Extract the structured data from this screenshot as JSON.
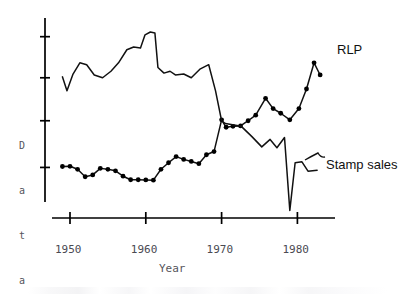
{
  "chart_data": {
    "type": "line",
    "title": "",
    "xlabel": "Year",
    "ylabel": "Data",
    "ylabel_letters": [
      "D",
      "a",
      "t",
      "a"
    ],
    "xlim": [
      1948.5,
      1983.5
    ],
    "ylim": [
      0,
      100
    ],
    "grid": false,
    "legend_position": "right-inline",
    "x_tick_labels": [
      "1950",
      "1960",
      "1970",
      "1980"
    ],
    "x_ticks": [
      1950,
      1960,
      1970,
      1980
    ],
    "y_ticks": [
      20,
      45,
      68,
      90
    ],
    "y_tick_labels": [
      "",
      "",
      "",
      ""
    ],
    "axis_color": "#000000",
    "line_color": "#1a1a1a",
    "marker_color": "#000000",
    "background": "#ffffff",
    "series": [
      {
        "name": "RLP",
        "label": "RLP",
        "markers": true,
        "marker_shape": "circle",
        "color": "#111111",
        "points": [
          {
            "x": 1949.0,
            "y": 20.5
          },
          {
            "x": 1950.0,
            "y": 20.6
          },
          {
            "x": 1951.0,
            "y": 19.0
          },
          {
            "x": 1952.0,
            "y": 15.0
          },
          {
            "x": 1953.0,
            "y": 16.0
          },
          {
            "x": 1954.0,
            "y": 19.5
          },
          {
            "x": 1955.0,
            "y": 19.0
          },
          {
            "x": 1956.0,
            "y": 18.2
          },
          {
            "x": 1957.0,
            "y": 15.3
          },
          {
            "x": 1958.0,
            "y": 13.4
          },
          {
            "x": 1959.0,
            "y": 13.4
          },
          {
            "x": 1960.0,
            "y": 13.3
          },
          {
            "x": 1961.0,
            "y": 13.2
          },
          {
            "x": 1962.0,
            "y": 19.0
          },
          {
            "x": 1963.0,
            "y": 22.5
          },
          {
            "x": 1964.0,
            "y": 25.8
          },
          {
            "x": 1965.0,
            "y": 24.3
          },
          {
            "x": 1966.0,
            "y": 23.2
          },
          {
            "x": 1967.0,
            "y": 22.0
          },
          {
            "x": 1968.0,
            "y": 26.8
          },
          {
            "x": 1969.0,
            "y": 28.5
          },
          {
            "x": 1970.0,
            "y": 45.5
          },
          {
            "x": 1970.6,
            "y": 41.5
          },
          {
            "x": 1971.5,
            "y": 42.0
          },
          {
            "x": 1972.5,
            "y": 42.2
          },
          {
            "x": 1973.5,
            "y": 45.0
          },
          {
            "x": 1974.5,
            "y": 48.0
          },
          {
            "x": 1975.8,
            "y": 57.0
          },
          {
            "x": 1976.8,
            "y": 51.5
          },
          {
            "x": 1977.8,
            "y": 49.0
          },
          {
            "x": 1979.0,
            "y": 45.5
          },
          {
            "x": 1980.2,
            "y": 51.5
          },
          {
            "x": 1981.2,
            "y": 62.0
          },
          {
            "x": 1982.2,
            "y": 76.0
          },
          {
            "x": 1983.0,
            "y": 69.5
          }
        ]
      },
      {
        "name": "Stamp sales",
        "label": "Stamp sales",
        "markers": false,
        "color": "#111111",
        "points": [
          {
            "x": 1949.0,
            "y": 68.5
          },
          {
            "x": 1949.6,
            "y": 61.0
          },
          {
            "x": 1950.4,
            "y": 70.0
          },
          {
            "x": 1951.3,
            "y": 76.0
          },
          {
            "x": 1952.2,
            "y": 75.0
          },
          {
            "x": 1953.2,
            "y": 69.5
          },
          {
            "x": 1954.3,
            "y": 68.0
          },
          {
            "x": 1955.4,
            "y": 71.5
          },
          {
            "x": 1956.4,
            "y": 76.0
          },
          {
            "x": 1957.5,
            "y": 83.0
          },
          {
            "x": 1958.4,
            "y": 84.5
          },
          {
            "x": 1959.3,
            "y": 84.0
          },
          {
            "x": 1959.9,
            "y": 91.0
          },
          {
            "x": 1960.6,
            "y": 92.5
          },
          {
            "x": 1961.2,
            "y": 92.0
          },
          {
            "x": 1961.6,
            "y": 73.5
          },
          {
            "x": 1962.4,
            "y": 70.5
          },
          {
            "x": 1963.2,
            "y": 71.5
          },
          {
            "x": 1963.9,
            "y": 69.5
          },
          {
            "x": 1965.0,
            "y": 70.0
          },
          {
            "x": 1966.0,
            "y": 68.0
          },
          {
            "x": 1967.2,
            "y": 72.8
          },
          {
            "x": 1968.3,
            "y": 75.0
          },
          {
            "x": 1969.2,
            "y": 61.0
          },
          {
            "x": 1970.0,
            "y": 45.0
          },
          {
            "x": 1970.5,
            "y": 43.5
          },
          {
            "x": 1972.6,
            "y": 42.0
          },
          {
            "x": 1974.0,
            "y": 36.5
          },
          {
            "x": 1975.3,
            "y": 31.0
          },
          {
            "x": 1976.4,
            "y": 35.0
          },
          {
            "x": 1977.3,
            "y": 30.5
          },
          {
            "x": 1978.3,
            "y": 36.0
          },
          {
            "x": 1979.0,
            "y": -3.0
          },
          {
            "x": 1979.7,
            "y": 22.5
          },
          {
            "x": 1980.6,
            "y": 23.0
          },
          {
            "x": 1981.4,
            "y": 18.0
          },
          {
            "x": 1982.6,
            "y": 18.5
          }
        ]
      }
    ],
    "annotations": [
      {
        "text": "RLP",
        "x_px": 337,
        "y_px": 42
      },
      {
        "text": "Stamp sales",
        "x_px": 326,
        "y_px": 157
      }
    ]
  }
}
